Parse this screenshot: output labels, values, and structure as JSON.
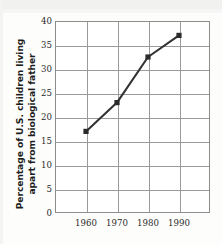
{
  "figure": {
    "kind": "scanned-textbook-line-chart",
    "y_axis_title_line1": "Percentage of U.S. children living",
    "y_axis_title_line2": "apart from biological father",
    "colors": {
      "line": "#333333",
      "marker": "#2b2b2b",
      "grid": "#9a9a9a",
      "frame": "#8d8d8d",
      "text": "#1d1d1d",
      "background": "#ffffff",
      "scan_band": "#ececec"
    }
  },
  "chart_data": {
    "type": "line",
    "title": "",
    "xlabel": "",
    "ylabel": "Percentage of U.S. children living apart from biological father",
    "categories": [
      "1960",
      "1970",
      "1980",
      "1990"
    ],
    "x": [
      1960,
      1970,
      1980,
      1990
    ],
    "values": [
      17,
      23,
      32.5,
      37
    ],
    "series": [
      {
        "name": "Percentage of U.S. children living apart from biological father",
        "values": [
          17,
          23,
          32.5,
          37
        ]
      }
    ],
    "ylim": [
      0,
      40
    ],
    "yticks": [
      0,
      5,
      10,
      15,
      20,
      25,
      30,
      35,
      40
    ],
    "ytick_labels": [
      "0",
      "5",
      "10",
      "15",
      "20",
      "25",
      "30",
      "35",
      "40"
    ],
    "xtick_labels": [
      "1960",
      "1970",
      "1980",
      "1990"
    ],
    "grid": true,
    "grid_axis": "both",
    "legend": false,
    "legend_position": "none",
    "marker": "square",
    "x_columns": 5,
    "annotations": []
  }
}
